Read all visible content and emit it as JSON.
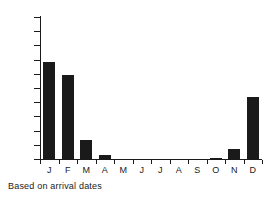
{
  "caption": "Based on arrival dates",
  "colors": {
    "bar": "#1a1a1a",
    "axis": "#1a1a1a",
    "background": "#ffffff",
    "text": "#1a1a1a"
  },
  "axis": {
    "y_ticks": [
      0,
      20,
      40,
      60,
      80,
      100,
      120,
      140,
      160,
      180,
      200
    ],
    "y_tick_labels": [
      "0",
      "20",
      "40",
      "60",
      "80",
      "100",
      "120",
      "140",
      "160",
      "180",
      "200"
    ],
    "x_tick_labels": [
      "J",
      "F",
      "M",
      "A",
      "M",
      "J",
      "J",
      "A",
      "S",
      "O",
      "N",
      "D"
    ]
  },
  "chart_data": {
    "type": "bar",
    "title": "",
    "subtitle": "",
    "xlabel": "",
    "ylabel": "",
    "categories": [
      "J",
      "F",
      "M",
      "A",
      "M",
      "J",
      "J",
      "A",
      "S",
      "O",
      "N",
      "D"
    ],
    "category_names": [
      "January",
      "February",
      "March",
      "April",
      "May",
      "June",
      "July",
      "August",
      "September",
      "October",
      "November",
      "December"
    ],
    "values": [
      136,
      118,
      27,
      5,
      0,
      0,
      0,
      0,
      0,
      1,
      14,
      87
    ],
    "ylim": [
      0,
      200
    ],
    "ytick_step": 20,
    "grid": false,
    "legend": false,
    "annotations": [
      "Based on arrival dates"
    ]
  }
}
